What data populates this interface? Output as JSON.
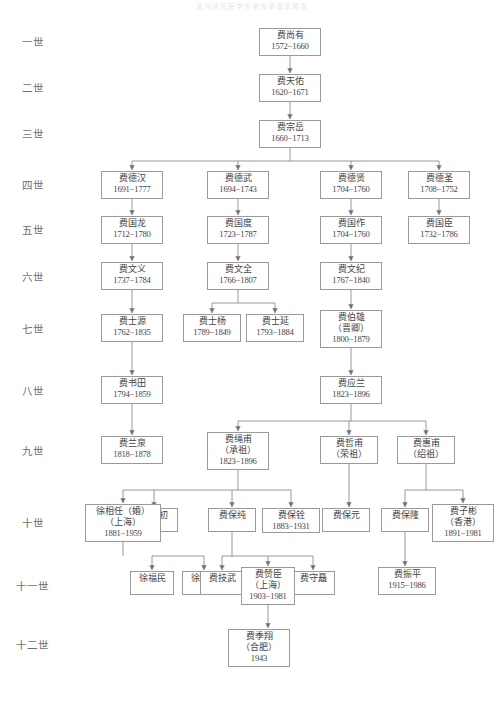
{
  "title": "孟河费氏医学世家传承谱系简表",
  "generation_labels": [
    {
      "id": "gen-1",
      "label": "一世",
      "x": 22,
      "y": 34
    },
    {
      "id": "gen-2",
      "label": "二世",
      "x": 22,
      "y": 80
    },
    {
      "id": "gen-3",
      "label": "三世",
      "x": 22,
      "y": 126
    },
    {
      "id": "gen-4",
      "label": "四世",
      "x": 22,
      "y": 177
    },
    {
      "id": "gen-5",
      "label": "五世",
      "x": 22,
      "y": 222
    },
    {
      "id": "gen-6",
      "label": "六世",
      "x": 22,
      "y": 269
    },
    {
      "id": "gen-7",
      "label": "七世",
      "x": 22,
      "y": 321
    },
    {
      "id": "gen-8",
      "label": "八世",
      "x": 22,
      "y": 383
    },
    {
      "id": "gen-9",
      "label": "九世",
      "x": 22,
      "y": 443
    },
    {
      "id": "gen-10",
      "label": "十世",
      "x": 22,
      "y": 515
    },
    {
      "id": "gen-11",
      "label": "十一世",
      "x": 16,
      "y": 578
    },
    {
      "id": "gen-12",
      "label": "十二世",
      "x": 16,
      "y": 637
    }
  ],
  "nodes": [
    {
      "id": "fei-shangyou",
      "name": "费尚有",
      "years": "1572−1660",
      "x": 259,
      "y": 28,
      "w": 62,
      "h": 28
    },
    {
      "id": "fei-tianyou",
      "name": "费天佑",
      "years": "1620−1671",
      "x": 259,
      "y": 74,
      "w": 62,
      "h": 28
    },
    {
      "id": "fei-zongyue",
      "name": "费宗岳",
      "years": "1660−1713",
      "x": 259,
      "y": 120,
      "w": 62,
      "h": 28
    },
    {
      "id": "fei-dehan",
      "name": "费德汉",
      "years": "1691−1777",
      "x": 101,
      "y": 171,
      "w": 62,
      "h": 28
    },
    {
      "id": "fei-dewu",
      "name": "费德武",
      "years": "1694−1743",
      "x": 207,
      "y": 171,
      "w": 62,
      "h": 28
    },
    {
      "id": "fei-dexian",
      "name": "费德贤",
      "years": "1704−1760",
      "x": 320,
      "y": 171,
      "w": 62,
      "h": 28
    },
    {
      "id": "fei-desheng",
      "name": "费德圣",
      "years": "1708−1752",
      "x": 408,
      "y": 171,
      "w": 62,
      "h": 28
    },
    {
      "id": "fei-guolong",
      "name": "费国龙",
      "years": "1712−1780",
      "x": 101,
      "y": 216,
      "w": 62,
      "h": 28
    },
    {
      "id": "fei-guodu",
      "name": "费国度",
      "years": "1723−1787",
      "x": 207,
      "y": 216,
      "w": 62,
      "h": 28
    },
    {
      "id": "fei-guozuo",
      "name": "费国作",
      "years": "1704−1760",
      "x": 320,
      "y": 216,
      "w": 62,
      "h": 28
    },
    {
      "id": "fei-guochen",
      "name": "费国臣",
      "years": "1732−1786",
      "x": 408,
      "y": 216,
      "w": 62,
      "h": 28
    },
    {
      "id": "fei-wenyi",
      "name": "费文义",
      "years": "1737−1784",
      "x": 101,
      "y": 262,
      "w": 62,
      "h": 28
    },
    {
      "id": "fei-wenquan",
      "name": "费文全",
      "years": "1766−1807",
      "x": 207,
      "y": 262,
      "w": 62,
      "h": 28
    },
    {
      "id": "fei-wenji",
      "name": "费文纪",
      "years": "1767−1840",
      "x": 320,
      "y": 262,
      "w": 62,
      "h": 28
    },
    {
      "id": "fei-shiyuan",
      "name": "费士源",
      "years": "1762−1835",
      "x": 101,
      "y": 314,
      "w": 62,
      "h": 28
    },
    {
      "id": "fei-shiyang",
      "name": "费士杨",
      "years": "1789−1849",
      "x": 183,
      "y": 314,
      "w": 58,
      "h": 28
    },
    {
      "id": "fei-shiyan",
      "name": "费士延",
      "years": "1793−1884",
      "x": 246,
      "y": 314,
      "w": 58,
      "h": 28
    },
    {
      "id": "fei-shutian",
      "name": "费书田",
      "years": "1794−1859",
      "x": 101,
      "y": 376,
      "w": 62,
      "h": 28
    },
    {
      "id": "fei-yinglan",
      "name": "费应兰",
      "years": "1823−1896",
      "x": 320,
      "y": 376,
      "w": 62,
      "h": 28
    },
    {
      "id": "fei-lanquan",
      "name": "费兰泉",
      "years": "1818−1878",
      "x": 101,
      "y": 436,
      "w": 62,
      "h": 28
    },
    {
      "id": "fei-zhefu",
      "name": "费哲甫",
      "alias": "（荣祖）",
      "years": "",
      "x": 320,
      "y": 436,
      "w": 58,
      "h": 28
    },
    {
      "id": "fei-huifu",
      "name": "费惠甫",
      "alias": "（绍祖）",
      "years": "",
      "x": 397,
      "y": 436,
      "w": 58,
      "h": 28
    },
    {
      "id": "fei-baochu",
      "name": "费保初",
      "years": "",
      "x": 130,
      "y": 508,
      "w": 48,
      "h": 24
    },
    {
      "id": "fei-baochun",
      "name": "费保纯",
      "years": "",
      "x": 208,
      "y": 508,
      "w": 48,
      "h": 24
    },
    {
      "id": "fei-baoyuan",
      "name": "费保元",
      "years": "",
      "x": 322,
      "y": 508,
      "w": 48,
      "h": 24
    },
    {
      "id": "fei-baolong",
      "name": "费保隆",
      "years": "",
      "x": 381,
      "y": 508,
      "w": 48,
      "h": 24
    },
    {
      "id": "fei-fumin",
      "name": "徐福民",
      "years": "",
      "x": 130,
      "y": 571,
      "w": 44,
      "h": 24
    },
    {
      "id": "fei-limin",
      "name": "徐利民",
      "years": "",
      "x": 182,
      "y": 571,
      "w": 44,
      "h": 24
    },
    {
      "id": "fei-jiwu",
      "name": "费技武",
      "years": "",
      "x": 200,
      "y": 571,
      "w": 44,
      "h": 24
    },
    {
      "id": "fei-shouzhu",
      "name": "费守矗",
      "years": "",
      "x": 291,
      "y": 571,
      "w": 44,
      "h": 24
    },
    {
      "id": "fei-zhenping",
      "name": "费振平",
      "years": "1915−1986",
      "x": 378,
      "y": 567,
      "w": 58,
      "h": 28
    }
  ],
  "multiline_nodes": [
    {
      "id": "fei-bo-xiong",
      "lines": [
        "费伯雄",
        "（晋卿）",
        "1800−1879"
      ],
      "x": 320,
      "y": 310,
      "w": 62,
      "h": 38
    },
    {
      "id": "fei-shengfu",
      "lines": [
        "费绳甫",
        "（承祖）",
        "1823−1896"
      ],
      "x": 207,
      "y": 432,
      "w": 62,
      "h": 38
    },
    {
      "id": "xu-xiangren",
      "lines": [
        "徐相任（婚）",
        "（上海）",
        "1881−1959"
      ],
      "x": 85,
      "y": 504,
      "w": 76,
      "h": 38
    },
    {
      "id": "fei-baoquan",
      "lines": [
        "费保铨",
        "1883−1931"
      ],
      "x": 262,
      "y": 508,
      "w": 58,
      "h": 24
    },
    {
      "id": "fei-zibin",
      "lines": [
        "费子彬",
        "（香港）",
        "1891−1981"
      ],
      "x": 432,
      "y": 504,
      "w": 62,
      "h": 38
    },
    {
      "id": "fei-zanchen",
      "lines": [
        "费赞臣",
        "（上海）",
        "1903−1981"
      ],
      "x": 241,
      "y": 567,
      "w": 54,
      "h": 38
    },
    {
      "id": "fei-jixiang",
      "lines": [
        "费季翔",
        "（合肥）",
        "1943"
      ],
      "x": 228,
      "y": 629,
      "w": 62,
      "h": 38
    }
  ],
  "colors": {
    "box_border": "#9a9a9a",
    "connector": "#8c8c8c",
    "text": "#444444",
    "label_text": "#6e6e6e",
    "background": "#ffffff"
  }
}
